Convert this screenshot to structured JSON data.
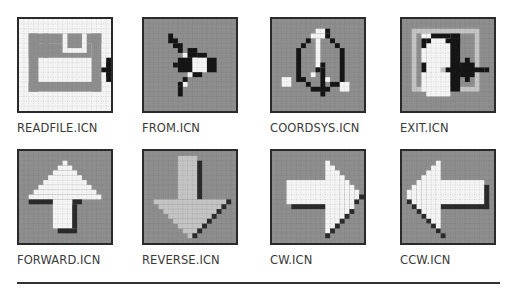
{
  "colors": {
    "gray_bg": "#8e8e8e",
    "grid_dot_dark": "#7a7a7a",
    "white": "#f8f8f8",
    "black": "#151515",
    "light_gray": "#c4c4c4",
    "shadow": "#2a2a2a",
    "border": "#2a2a2a"
  },
  "icons": [
    {
      "id": "readfile",
      "label": "READFILE.ICN",
      "x": 17,
      "y": 17,
      "bg": "#f4f4f4",
      "grid": "light",
      "rects": [
        [
          "#8e8e8e",
          2,
          3,
          15,
          2
        ],
        [
          "#8e8e8e",
          2,
          3,
          2,
          12
        ],
        [
          "#8e8e8e",
          15,
          3,
          2,
          12
        ],
        [
          "#8e8e8e",
          2,
          13,
          15,
          2
        ],
        [
          "#8e8e8e",
          2,
          5,
          13,
          3
        ],
        [
          "#8e8e8e",
          5,
          3,
          1,
          5
        ],
        [
          "#f4f4f4",
          9,
          3,
          5,
          4
        ],
        [
          "#8e8e8e",
          10,
          3,
          3,
          3
        ],
        [
          "#151515",
          17,
          10,
          3,
          1
        ],
        [
          "#151515",
          18,
          9,
          2,
          3
        ],
        [
          "#151515",
          18,
          8,
          1,
          5
        ],
        [
          "#151515",
          20,
          10,
          2,
          1
        ]
      ]
    },
    {
      "id": "from",
      "label": "FROM.ICN",
      "x": 142,
      "y": 17,
      "bg": "#8e8e8e",
      "grid": "dark",
      "rects": [
        [
          "#151515",
          5,
          3,
          1,
          2
        ],
        [
          "#151515",
          6,
          4,
          1,
          1
        ],
        [
          "#151515",
          6,
          5,
          2,
          1
        ],
        [
          "#151515",
          7,
          6,
          1,
          1
        ],
        [
          "#151515",
          9,
          6,
          2,
          1
        ],
        [
          "#f4f4f4",
          8,
          7,
          1,
          1
        ],
        [
          "#151515",
          9,
          7,
          2,
          1
        ],
        [
          "#f4f4f4",
          10,
          8,
          2,
          1
        ],
        [
          "#151515",
          11,
          7,
          2,
          1
        ],
        [
          "#151515",
          7,
          8,
          3,
          3
        ],
        [
          "#f4f4f4",
          10,
          8,
          3,
          3
        ],
        [
          "#151515",
          13,
          8,
          2,
          3
        ],
        [
          "#151515",
          10,
          11,
          2,
          1
        ],
        [
          "#f4f4f4",
          9,
          11,
          1,
          1
        ],
        [
          "#151515",
          8,
          12,
          1,
          1
        ],
        [
          "#f4f4f4",
          8,
          13,
          1,
          1
        ],
        [
          "#151515",
          7,
          13,
          1,
          1
        ],
        [
          "#151515",
          7,
          14,
          1,
          2
        ],
        [
          "#151515",
          6,
          9,
          1,
          1
        ]
      ]
    },
    {
      "id": "coordsys",
      "label": "COORDSYS.ICN",
      "x": 270,
      "y": 17,
      "bg": "#8e8e8e",
      "grid": "dark",
      "rects": [
        [
          "#f4f4f4",
          9,
          2,
          2,
          1
        ],
        [
          "#151515",
          11,
          2,
          1,
          1
        ],
        [
          "#f4f4f4",
          8,
          3,
          3,
          1
        ],
        [
          "#151515",
          11,
          3,
          1,
          1
        ],
        [
          "#151515",
          12,
          4,
          1,
          1
        ],
        [
          "#151515",
          7,
          4,
          1,
          1
        ],
        [
          "#f4f4f4",
          9,
          4,
          1,
          6
        ],
        [
          "#151515",
          6,
          5,
          1,
          1
        ],
        [
          "#151515",
          13,
          5,
          1,
          1
        ],
        [
          "#151515",
          5,
          6,
          1,
          7
        ],
        [
          "#151515",
          14,
          6,
          1,
          8
        ],
        [
          "#151515",
          9,
          10,
          1,
          1
        ],
        [
          "#151515",
          10,
          9,
          1,
          1
        ],
        [
          "#151515",
          10,
          10,
          1,
          5
        ],
        [
          "#f4f4f4",
          8,
          11,
          1,
          1
        ],
        [
          "#f4f4f4",
          11,
          12,
          1,
          1
        ],
        [
          "#151515",
          6,
          12,
          1,
          1
        ],
        [
          "#151515",
          7,
          13,
          1,
          1
        ],
        [
          "#151515",
          8,
          14,
          4,
          1
        ],
        [
          "#151515",
          12,
          13,
          1,
          1
        ],
        [
          "#151515",
          13,
          13,
          1,
          1
        ],
        [
          "#f4f4f4",
          2,
          12,
          2,
          2
        ],
        [
          "#f4f4f4",
          14,
          13,
          2,
          2
        ],
        [
          "#151515",
          10,
          15,
          1,
          1
        ]
      ]
    },
    {
      "id": "exit",
      "label": "EXIT.ICN",
      "x": 400,
      "y": 17,
      "bg": "#8e8e8e",
      "grid": "dark",
      "rects": [
        [
          "#c4c4c4",
          2,
          2,
          14,
          13
        ],
        [
          "#8e8e8e",
          3,
          3,
          12,
          11
        ],
        [
          "#f4f4f4",
          4,
          3,
          1,
          12
        ],
        [
          "#f4f4f4",
          5,
          3,
          5,
          13
        ],
        [
          "#151515",
          6,
          3,
          4,
          1
        ],
        [
          "#151515",
          5,
          4,
          1,
          1
        ],
        [
          "#151515",
          4,
          4,
          1,
          2
        ],
        [
          "#151515",
          10,
          3,
          2,
          1
        ],
        [
          "#151515",
          9,
          4,
          3,
          1
        ],
        [
          "#151515",
          10,
          4,
          2,
          11
        ],
        [
          "#151515",
          4,
          9,
          1,
          2
        ],
        [
          "#c4c4c4",
          8,
          10,
          1,
          1
        ],
        [
          "#151515",
          9,
          10,
          8,
          1
        ],
        [
          "#151515",
          13,
          8,
          1,
          5
        ],
        [
          "#151515",
          12,
          9,
          3,
          3
        ],
        [
          "#151515",
          17,
          10,
          1,
          1
        ]
      ]
    },
    {
      "id": "forward",
      "label": "FORWARD.ICN",
      "x": 17,
      "y": 149,
      "bg": "#8e8e8e",
      "grid": "dark",
      "rects": [
        [
          "#f4f4f4",
          9,
          2,
          1,
          1
        ],
        [
          "#f4f4f4",
          8,
          3,
          3,
          1
        ],
        [
          "#f4f4f4",
          7,
          4,
          5,
          1
        ],
        [
          "#f4f4f4",
          6,
          5,
          7,
          1
        ],
        [
          "#f4f4f4",
          5,
          6,
          9,
          1
        ],
        [
          "#f4f4f4",
          4,
          7,
          11,
          1
        ],
        [
          "#f4f4f4",
          3,
          8,
          13,
          1
        ],
        [
          "#f4f4f4",
          2,
          9,
          15,
          1
        ],
        [
          "#2a2a2a",
          2,
          10,
          5,
          1
        ],
        [
          "#2a2a2a",
          11,
          10,
          2,
          1
        ],
        [
          "#f4f4f4",
          7,
          10,
          4,
          6
        ],
        [
          "#2a2a2a",
          11,
          11,
          1,
          5
        ],
        [
          "#2a2a2a",
          8,
          16,
          4,
          1
        ]
      ]
    },
    {
      "id": "reverse",
      "label": "REVERSE.ICN",
      "x": 142,
      "y": 149,
      "bg": "#8e8e8e",
      "grid": "dark",
      "rects": [
        [
          "#c4c4c4",
          7,
          1,
          4,
          9
        ],
        [
          "#2a2a2a",
          11,
          2,
          1,
          8
        ],
        [
          "#c4c4c4",
          2,
          10,
          15,
          1
        ],
        [
          "#c4c4c4",
          3,
          11,
          13,
          1
        ],
        [
          "#c4c4c4",
          4,
          12,
          11,
          1
        ],
        [
          "#c4c4c4",
          5,
          13,
          9,
          1
        ],
        [
          "#c4c4c4",
          6,
          14,
          7,
          1
        ],
        [
          "#c4c4c4",
          7,
          15,
          5,
          1
        ],
        [
          "#c4c4c4",
          8,
          16,
          3,
          1
        ],
        [
          "#c4c4c4",
          9,
          17,
          1,
          1
        ],
        [
          "#2a2a2a",
          17,
          10,
          1,
          1
        ],
        [
          "#2a2a2a",
          16,
          11,
          1,
          1
        ],
        [
          "#2a2a2a",
          15,
          12,
          1,
          1
        ],
        [
          "#2a2a2a",
          14,
          13,
          1,
          1
        ],
        [
          "#2a2a2a",
          13,
          14,
          1,
          1
        ],
        [
          "#2a2a2a",
          12,
          15,
          1,
          1
        ],
        [
          "#2a2a2a",
          11,
          16,
          1,
          1
        ],
        [
          "#2a2a2a",
          10,
          17,
          1,
          1
        ]
      ]
    },
    {
      "id": "cw",
      "label": "CW.ICN",
      "x": 270,
      "y": 149,
      "bg": "#8e8e8e",
      "grid": "dark",
      "rects": [
        [
          "#f4f4f4",
          3,
          6,
          10,
          5
        ],
        [
          "#2a2a2a",
          4,
          11,
          8,
          1
        ],
        [
          "#f4f4f4",
          11,
          2,
          1,
          15
        ],
        [
          "#f4f4f4",
          12,
          3,
          1,
          13
        ],
        [
          "#f4f4f4",
          13,
          4,
          1,
          11
        ],
        [
          "#f4f4f4",
          14,
          5,
          1,
          9
        ],
        [
          "#f4f4f4",
          15,
          6,
          1,
          7
        ],
        [
          "#f4f4f4",
          16,
          7,
          1,
          5
        ],
        [
          "#f4f4f4",
          17,
          8,
          1,
          3
        ],
        [
          "#2a2a2a",
          18,
          9,
          1,
          1
        ],
        [
          "#2a2a2a",
          17,
          10,
          1,
          1
        ],
        [
          "#2a2a2a",
          16,
          12,
          1,
          1
        ],
        [
          "#2a2a2a",
          15,
          13,
          1,
          1
        ],
        [
          "#2a2a2a",
          14,
          14,
          1,
          1
        ],
        [
          "#2a2a2a",
          13,
          15,
          1,
          1
        ],
        [
          "#2a2a2a",
          12,
          16,
          1,
          1
        ],
        [
          "#2a2a2a",
          11,
          17,
          1,
          1
        ]
      ]
    },
    {
      "id": "ccw",
      "label": "CCW.ICN",
      "x": 400,
      "y": 149,
      "bg": "#8e8e8e",
      "grid": "dark",
      "rects": [
        [
          "#f4f4f4",
          7,
          6,
          10,
          5
        ],
        [
          "#2a2a2a",
          17,
          7,
          1,
          5
        ],
        [
          "#2a2a2a",
          8,
          11,
          10,
          1
        ],
        [
          "#f4f4f4",
          7,
          2,
          1,
          15
        ],
        [
          "#f4f4f4",
          6,
          3,
          1,
          13
        ],
        [
          "#f4f4f4",
          5,
          4,
          1,
          11
        ],
        [
          "#f4f4f4",
          4,
          5,
          1,
          9
        ],
        [
          "#f4f4f4",
          3,
          6,
          1,
          7
        ],
        [
          "#f4f4f4",
          2,
          7,
          1,
          5
        ],
        [
          "#f4f4f4",
          1,
          8,
          1,
          3
        ],
        [
          "#2a2a2a",
          1,
          10,
          1,
          1
        ],
        [
          "#2a2a2a",
          2,
          11,
          1,
          1
        ],
        [
          "#2a2a2a",
          3,
          12,
          1,
          1
        ],
        [
          "#2a2a2a",
          4,
          13,
          1,
          1
        ],
        [
          "#2a2a2a",
          5,
          14,
          1,
          1
        ],
        [
          "#2a2a2a",
          6,
          15,
          1,
          1
        ],
        [
          "#2a2a2a",
          7,
          16,
          1,
          1
        ],
        [
          "#2a2a2a",
          8,
          17,
          1,
          1
        ]
      ]
    }
  ]
}
